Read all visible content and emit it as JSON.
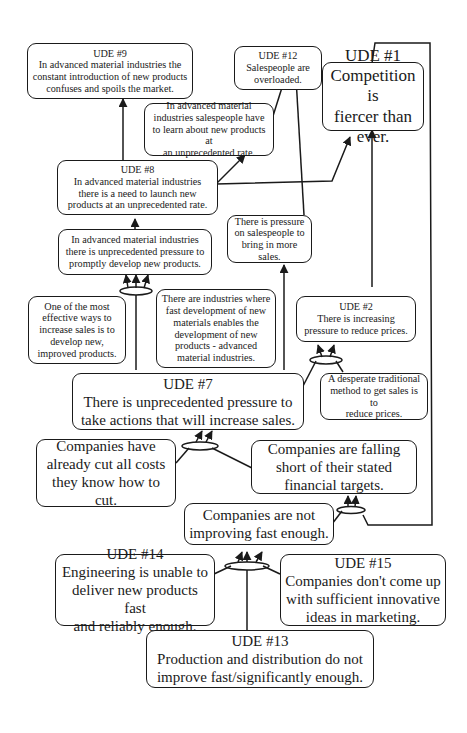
{
  "diagram": {
    "type": "current-reality-tree",
    "nodes": {
      "ude9": {
        "title": "UDE #9",
        "text": "In advanced material industries the constant introduction of new products confuses and spoils the market."
      },
      "ude12": {
        "title": "UDE #12",
        "text": "Salespeople are overloaded."
      },
      "ude1": {
        "title": "UDE #1",
        "text": "Competition is fiercer than ever."
      },
      "learn": {
        "title": "",
        "text": "In advanced material industries salespeople have to learn about new products at an unprecedented rate."
      },
      "ude8": {
        "title": "UDE #8",
        "text": "In advanced material industries there is a need to launch new products at an unprecedented rate."
      },
      "pressure_sales": {
        "title": "",
        "text": "There is pressure on salespeople to bring in more sales."
      },
      "develop": {
        "title": "",
        "text": "In advanced material industries there is unprecedented pressure to promptly develop new products."
      },
      "effective": {
        "title": "",
        "text": "One of the most effective ways to increase sales is to develop new, improved products."
      },
      "industries": {
        "title": "",
        "text": "There are industries where fast development of new materials enables the development of new products - advanced material industries."
      },
      "ude2": {
        "title": "UDE #2",
        "text": "There is increasing pressure to reduce prices."
      },
      "ude7": {
        "title": "UDE #7",
        "text": "There is unprecedented pressure to take actions that will increase sales."
      },
      "desperate": {
        "title": "",
        "text": "A desperate traditional method to get sales is to reduce prices."
      },
      "costs": {
        "title": "",
        "text": "Companies have already cut all costs they know how to cut."
      },
      "falling": {
        "title": "",
        "text": "Companies are falling short of their stated financial targets."
      },
      "not_improving": {
        "title": "",
        "text": "Companies are not improving fast enough."
      },
      "ude14": {
        "title": "UDE #14",
        "text": "Engineering is unable to deliver new products fast and reliably enough."
      },
      "ude15": {
        "title": "UDE #15",
        "text": "Companies don't come up with sufficient innovative ideas in marketing."
      },
      "ude13": {
        "title": "UDE #13",
        "text": "Production and distribution do not improve fast/significantly enough."
      }
    },
    "lines": {
      "ude9": [
        "In advanced material industries the",
        "constant introduction of new products",
        "confuses and spoils the market."
      ],
      "ude12": [
        "Salespeople are",
        "overloaded."
      ],
      "ude1": [
        "Competition is",
        "fiercer than",
        "ever."
      ],
      "learn": [
        "In advanced material",
        "industries salespeople have",
        "to learn about new products at",
        "an unprecedented rate."
      ],
      "ude8": [
        "In advanced material industries",
        "there is a need to launch new",
        "products at an unprecedented rate."
      ],
      "pressure_sales": [
        "There is pressure",
        "on salespeople to",
        "bring in more sales."
      ],
      "develop": [
        "In advanced material industries",
        "there is unprecedented pressure to",
        "promptly develop new products."
      ],
      "effective": [
        "One of the most",
        "effective ways to",
        "increase sales is to",
        "develop new,",
        "improved products."
      ],
      "industries": [
        "There are industries where",
        "fast development of new",
        "materials enables the",
        "development of new",
        "products - advanced",
        "material industries."
      ],
      "ude2": [
        "There is increasing",
        "pressure to reduce prices."
      ],
      "ude7": [
        "There is unprecedented pressure to",
        "take actions that will increase sales."
      ],
      "desperate": [
        "A desperate traditional",
        "method to get sales is to",
        "reduce prices."
      ],
      "costs": [
        "Companies have",
        "already cut all costs",
        "they know how to cut."
      ],
      "falling": [
        "Companies are falling",
        "short of their stated",
        "financial targets."
      ],
      "not_improving": [
        "Companies are not",
        "improving fast enough."
      ],
      "ude14": [
        "Engineering is unable to",
        "deliver new products fast",
        "and reliably enough."
      ],
      "ude15": [
        "Companies don't come up",
        "with sufficient innovative",
        "ideas in marketing."
      ],
      "ude13": [
        "Production and distribution do not",
        "improve fast/significantly enough."
      ]
    },
    "edges": [
      {
        "from": "ude8",
        "to": "ude9"
      },
      {
        "from": [
          "learn",
          "pressure_sales"
        ],
        "to": "ude12",
        "and": true
      },
      {
        "from": "ude8",
        "to": "learn"
      },
      {
        "from": "ude8",
        "to": "ude1"
      },
      {
        "from": "ude2",
        "to": "ude1"
      },
      {
        "from": "not_improving",
        "to": "ude1"
      },
      {
        "from": "develop",
        "to": "ude8"
      },
      {
        "from": [
          "effective",
          "industries",
          "ude7"
        ],
        "to": "develop",
        "and": true
      },
      {
        "from": "ude7",
        "to": "pressure_sales"
      },
      {
        "from": [
          "ude7",
          "desperate"
        ],
        "to": "ude2",
        "and": true
      },
      {
        "from": [
          "costs",
          "falling"
        ],
        "to": "ude7",
        "and": true
      },
      {
        "from": "not_improving",
        "to": "falling"
      },
      {
        "from": [
          "ude14",
          "ude13",
          "ude15"
        ],
        "to": "not_improving",
        "and": true
      }
    ],
    "colors": {
      "stroke": "#1a1a1a",
      "background": "#ffffff"
    }
  }
}
